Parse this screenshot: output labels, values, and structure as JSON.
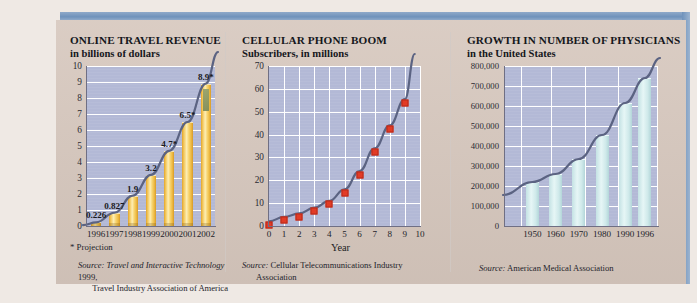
{
  "theme": {
    "card_bg": "#d6c7bd",
    "accent_blue": "#6f92bb",
    "plot_bg": "#b3b9d6",
    "bar_gold": "#f2c558",
    "bar_cyan": "#cfe9ea",
    "marker_red": "#e23b26",
    "curve_navy": "#5b6382"
  },
  "panels": [
    {
      "id": "online-travel-revenue",
      "title": "ONLINE TRAVEL REVENUE",
      "subtitle": "in billions of dollars",
      "note": "* Projection",
      "source_lead": "Source:",
      "source_line1": "Travel and Interactive Technology",
      "source_line1_tail": " 1999,",
      "source_line2": "Travel Industry Association of America"
    },
    {
      "id": "cellular-phone-boom",
      "title": "CELLULAR PHONE BOOM",
      "subtitle": "Subscribers, in millions",
      "axis_name": "Year",
      "source_lead": "Source:",
      "source_line1": "Cellular Telecommunications Industry",
      "source_line2": "Association"
    },
    {
      "id": "growth-number-of-physicians",
      "title": "GROWTH IN NUMBER OF PHYSICIANS",
      "subtitle": "in the United States",
      "source_lead": "Source:",
      "source_line1": "American Medical Association"
    }
  ],
  "chart_data": [
    {
      "type": "bar",
      "title": "ONLINE TRAVEL REVENUE",
      "subtitle": "in billions of dollars",
      "xlabel": "",
      "ylabel": "in billions of dollars",
      "ylim": [
        0,
        10
      ],
      "yticks": [
        0,
        1,
        2,
        3,
        4,
        5,
        6,
        7,
        8,
        9,
        10
      ],
      "ytick_labels": [
        "0",
        "1",
        "2",
        "3",
        "4",
        "5",
        "6",
        "7",
        "8",
        "9",
        "10"
      ],
      "grid": true,
      "categories": [
        "1996",
        "1997",
        "1998",
        "1999",
        "2000",
        "2001",
        "2002"
      ],
      "values": [
        0.226,
        0.827,
        1.9,
        3.2,
        4.7,
        6.5,
        8.9
      ],
      "data_labels": [
        "0.226",
        "0.827",
        "1.9",
        "3.2",
        "4.7*",
        "6.5*",
        "8.9*"
      ],
      "annotation": "* Projection",
      "trend_overlay": "exponential growth curve",
      "source": "Source: Travel and Interactive Technology 1999, Travel Industry Association of America"
    },
    {
      "type": "scatter",
      "title": "CELLULAR PHONE BOOM",
      "subtitle": "Subscribers, in millions",
      "xlabel": "Year",
      "ylabel": "Subscribers, in millions",
      "xlim": [
        0,
        10
      ],
      "ylim": [
        0,
        70
      ],
      "xticks": [
        0,
        1,
        2,
        3,
        4,
        5,
        6,
        7,
        8,
        9,
        10
      ],
      "xtick_labels": [
        "0",
        "1",
        "2",
        "3",
        "4",
        "5",
        "6",
        "7",
        "8",
        "9",
        "10"
      ],
      "yticks": [
        0,
        10,
        20,
        30,
        40,
        50,
        60,
        70
      ],
      "ytick_labels": [
        "0",
        "10",
        "20",
        "30",
        "40",
        "50",
        "60",
        "70"
      ],
      "grid": true,
      "x": [
        0,
        1,
        2,
        3,
        4,
        5,
        6,
        7,
        8,
        9
      ],
      "values": [
        2,
        4,
        5.5,
        8,
        11,
        16,
        24,
        34,
        44,
        55.5
      ],
      "trend_overlay": "fitted exponential curve through markers",
      "source": "Source: Cellular Telecommunications Industry Association"
    },
    {
      "type": "bar",
      "title": "GROWTH IN NUMBER OF PHYSICIANS",
      "subtitle": "in the United States",
      "xlabel": "",
      "ylabel": "Number of physicians",
      "ylim": [
        0,
        800000
      ],
      "yticks": [
        0,
        100000,
        200000,
        300000,
        400000,
        500000,
        600000,
        700000,
        800000
      ],
      "ytick_labels": [
        "0",
        "100,000",
        "200,000",
        "300,000",
        "400,000",
        "500,000",
        "600,000",
        "700,000",
        "800,000"
      ],
      "grid": true,
      "categories": [
        "1950",
        "1960",
        "1970",
        "1980",
        "1990",
        "1996"
      ],
      "values": [
        220000,
        260000,
        335000,
        455000,
        615000,
        740000
      ],
      "trend_overlay": "rising curve across bar tops",
      "source": "Source: American Medical Association"
    }
  ]
}
